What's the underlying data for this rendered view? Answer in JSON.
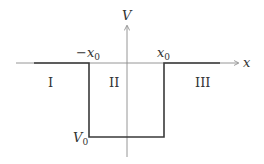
{
  "diagram": {
    "type": "finite square potential well",
    "axes": {
      "vertical_label": "V",
      "horizontal_label": "x"
    },
    "markers": {
      "left_edge": {
        "prefix": "−x",
        "subscript": "0"
      },
      "right_edge": {
        "prefix": "x",
        "subscript": "0"
      },
      "depth": {
        "prefix": "V",
        "subscript": "0"
      }
    },
    "regions": [
      {
        "label": "I"
      },
      {
        "label": "II"
      },
      {
        "label": "III"
      }
    ],
    "colors": {
      "potential_line": "#3a3a3a",
      "axis_line": "#8a8a8a",
      "text": "#333333"
    }
  }
}
